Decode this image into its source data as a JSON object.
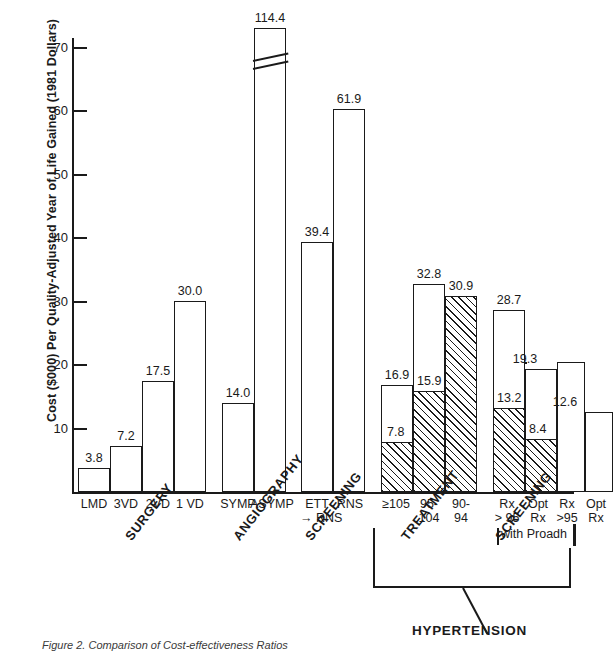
{
  "chart_data": {
    "type": "bar",
    "title": "",
    "xlabel": "",
    "ylabel": "Cost ($000) Per Quality-Adjusted Year of Life Gained (1981 Dollars)",
    "ylim": [
      0,
      75
    ],
    "yticks": [
      10,
      20,
      30,
      40,
      50,
      60,
      70
    ],
    "ytick_labels": [
      "10",
      "20",
      "30",
      "40",
      "50",
      "60",
      "70"
    ],
    "grid": false,
    "legend": "none",
    "axis_break_note": "ASYMP bar is broken; true value 114.4 exceeds axis range",
    "categories": [
      "LMD",
      "3VD",
      "2VD",
      "1 VD",
      "SYMP",
      "ASYMP",
      "ETT",
      "RNS → RNS",
      "≥105",
      "95-104",
      "90-94",
      "Rx > 95",
      "Opt Rx",
      "Rx >95",
      "Opt Rx"
    ],
    "values": [
      3.8,
      7.2,
      17.5,
      30.0,
      14.0,
      114.4,
      39.4,
      61.9,
      16.9,
      32.8,
      30.9,
      28.7,
      19.3,
      20.4,
      12.6
    ],
    "value_labels": [
      "3.8",
      "7.2",
      "17.5",
      "30.0",
      "14.0",
      "114.4",
      "39.4",
      "61.9",
      "16.9",
      "32.8",
      "30.9",
      "28.7",
      "19.3",
      "",
      "12.6"
    ],
    "hatched_subvalues": [
      null,
      null,
      null,
      null,
      null,
      null,
      null,
      null,
      7.8,
      15.9,
      30.9,
      13.2,
      8.4,
      null,
      null
    ],
    "hatched_labels": [
      "",
      "",
      "",
      "",
      "",
      "",
      "",
      "",
      "7.8",
      "15.9",
      "",
      "13.2",
      "8.4",
      "",
      ""
    ],
    "groups": [
      {
        "name": "SURGERY",
        "members": [
          "LMD",
          "3VD",
          "2VD",
          "1 VD"
        ]
      },
      {
        "name": "ANGIOGRAPHY",
        "members": [
          "SYMP",
          "ASYMP"
        ]
      },
      {
        "name": "SCREENING",
        "members": [
          "ETT",
          "RNS → RNS"
        ]
      },
      {
        "name": "TREATMENT",
        "members": [
          "≥105",
          "95-104",
          "90-94"
        ]
      },
      {
        "name": "SCREENING",
        "members": [
          "Rx > 95",
          "Opt Rx",
          "Rx >95",
          "Opt Rx"
        ]
      }
    ],
    "super_group": "HYPERTENSION",
    "annotations": [
      "with Proadh"
    ]
  },
  "xtick_labels": [
    {
      "line1": "LMD",
      "line2": ""
    },
    {
      "line1": "3VD",
      "line2": ""
    },
    {
      "line1": "2VD",
      "line2": ""
    },
    {
      "line1": "1 VD",
      "line2": ""
    },
    {
      "line1": "SYMP",
      "line2": ""
    },
    {
      "line1": "ASYMP",
      "line2": ""
    },
    {
      "line1": "ETT",
      "line2": "→ RNS"
    },
    {
      "line1": "RNS",
      "line2": ""
    },
    {
      "line1": "≥105",
      "line2": ""
    },
    {
      "line1": "95-",
      "line2": "104"
    },
    {
      "line1": "90-",
      "line2": "94"
    },
    {
      "line1": "Rx",
      "line2": "> 95"
    },
    {
      "line1": "Opt",
      "line2": "Rx"
    },
    {
      "line1": "Rx",
      "line2": ">95"
    },
    {
      "line1": "Opt",
      "line2": "Rx"
    }
  ],
  "caption": "Figure 2. Comparison of Cost-effectiveness Ratios"
}
